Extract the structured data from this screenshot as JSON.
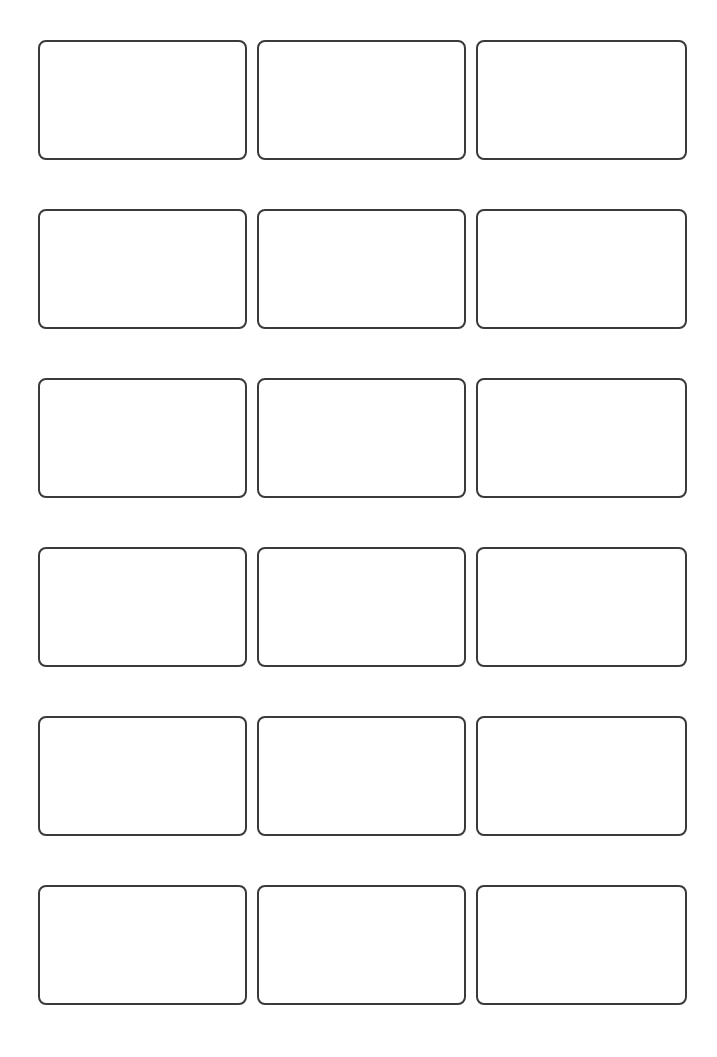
{
  "sheet": {
    "type": "label-template",
    "columns": 3,
    "rows": 6,
    "border_color": "#3a3a3a",
    "background_color": "#ffffff",
    "labels": [
      {
        "row": 1,
        "col": 1,
        "text": ""
      },
      {
        "row": 1,
        "col": 2,
        "text": ""
      },
      {
        "row": 1,
        "col": 3,
        "text": ""
      },
      {
        "row": 2,
        "col": 1,
        "text": ""
      },
      {
        "row": 2,
        "col": 2,
        "text": ""
      },
      {
        "row": 2,
        "col": 3,
        "text": ""
      },
      {
        "row": 3,
        "col": 1,
        "text": ""
      },
      {
        "row": 3,
        "col": 2,
        "text": ""
      },
      {
        "row": 3,
        "col": 3,
        "text": ""
      },
      {
        "row": 4,
        "col": 1,
        "text": ""
      },
      {
        "row": 4,
        "col": 2,
        "text": ""
      },
      {
        "row": 4,
        "col": 3,
        "text": ""
      },
      {
        "row": 5,
        "col": 1,
        "text": ""
      },
      {
        "row": 5,
        "col": 2,
        "text": ""
      },
      {
        "row": 5,
        "col": 3,
        "text": ""
      },
      {
        "row": 6,
        "col": 1,
        "text": ""
      },
      {
        "row": 6,
        "col": 2,
        "text": ""
      },
      {
        "row": 6,
        "col": 3,
        "text": ""
      }
    ]
  }
}
